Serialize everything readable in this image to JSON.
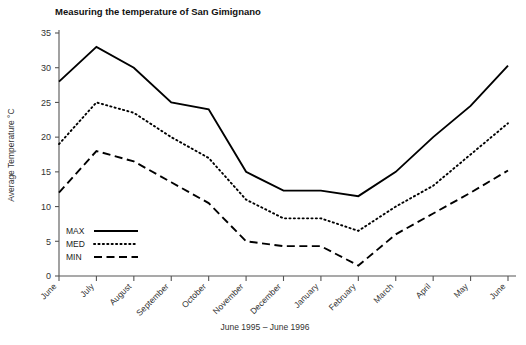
{
  "chart_data": {
    "type": "line",
    "title": "Measuring the temperature of San Gimignano",
    "xlabel": "June 1995 – June 1996",
    "ylabel": "Average Temperature °C",
    "categories": [
      "June",
      "July",
      "August",
      "September",
      "October",
      "November",
      "December",
      "January",
      "February",
      "March",
      "April",
      "May",
      "June"
    ],
    "yticks": [
      0,
      5,
      10,
      15,
      20,
      25,
      30,
      35
    ],
    "ylim": [
      0,
      35
    ],
    "grid": false,
    "legend_position": "inside-bottom-left",
    "series": [
      {
        "name": "MAX",
        "style": "solid",
        "values": [
          28,
          33,
          30,
          25,
          24,
          15,
          12.3,
          12.3,
          11.5,
          15,
          20,
          24.5,
          30.3
        ]
      },
      {
        "name": "MED",
        "style": "dotted",
        "values": [
          19,
          25,
          23.5,
          20,
          17,
          11,
          8.3,
          8.3,
          6.5,
          10,
          13,
          17.5,
          22
        ]
      },
      {
        "name": "MIN",
        "style": "dashed",
        "values": [
          12,
          18,
          16.5,
          13.5,
          10.5,
          5,
          4.3,
          4.3,
          1.5,
          6,
          9,
          12,
          15.2
        ]
      }
    ]
  },
  "legend": {
    "items": [
      {
        "label": "MAX"
      },
      {
        "label": "MED"
      },
      {
        "label": "MIN"
      }
    ]
  }
}
